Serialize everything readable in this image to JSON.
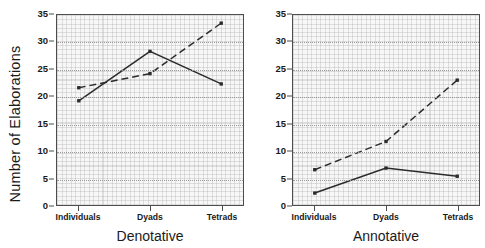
{
  "figure": {
    "ylabel": "Number of Elaborations"
  },
  "chart_data": [
    {
      "type": "line",
      "title": "",
      "xlabel": "Denotative",
      "ylabel": "Number of Elaborations",
      "categories": [
        "Individuals",
        "Dyads",
        "Tetrads"
      ],
      "xtick_labels": [
        "Individuals",
        "Dyads",
        "Tetrads"
      ],
      "ytick_labels": [
        "0",
        "5",
        "10",
        "15",
        "20",
        "25",
        "30",
        "35"
      ],
      "yticks": [
        0,
        5,
        10,
        15,
        20,
        25,
        30,
        35
      ],
      "ylim": [
        0,
        35
      ],
      "grid": true,
      "legend": "none",
      "series": [
        {
          "name": "solid",
          "style": "solid",
          "marker": "filled-square",
          "values": [
            19.2,
            28.3,
            22.3
          ]
        },
        {
          "name": "dashed",
          "style": "dashed",
          "marker": "filled-square",
          "values": [
            21.6,
            24.2,
            33.5
          ]
        }
      ]
    },
    {
      "type": "line",
      "title": "",
      "xlabel": "Annotative",
      "ylabel": "Number of Elaborations",
      "categories": [
        "Individuals",
        "Dyads",
        "Tetrads"
      ],
      "xtick_labels": [
        "Individuals",
        "Dyads",
        "Tetrads"
      ],
      "ytick_labels": [
        "0",
        "5",
        "10",
        "15",
        "20",
        "25",
        "30",
        "35"
      ],
      "yticks": [
        0,
        5,
        10,
        15,
        20,
        25,
        30,
        35
      ],
      "ylim": [
        0,
        35
      ],
      "grid": true,
      "legend": "none",
      "series": [
        {
          "name": "solid",
          "style": "solid",
          "marker": "filled-square",
          "values": [
            2.2,
            6.8,
            5.3
          ]
        },
        {
          "name": "dashed",
          "style": "dashed",
          "marker": "filled-square",
          "values": [
            6.5,
            11.7,
            23.0
          ]
        }
      ]
    }
  ],
  "colors": {
    "line": "#2b2b2b",
    "frame": "#4d4d4d",
    "plot_background": "#f7f7f7",
    "gridline": "#9b9b9b",
    "text": "#1a1a1a"
  }
}
